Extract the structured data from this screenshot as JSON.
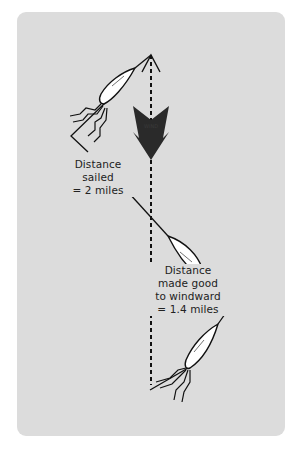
{
  "diagram": {
    "wind_arrow": {
      "label": "WIND",
      "direction": "down",
      "color": "#2a2a2a"
    },
    "labels": {
      "distance_sailed": {
        "lines": [
          "Distance",
          "sailed",
          "= 2 miles"
        ]
      },
      "distance_made_good": {
        "lines": [
          "Distance",
          "made good",
          "to windward",
          "= 1.4 miles"
        ]
      }
    },
    "boats": [
      {
        "name": "boat-upper",
        "heading": "port tack"
      },
      {
        "name": "boat-middle",
        "heading": "starboard tack"
      },
      {
        "name": "boat-lower",
        "heading": "port tack"
      }
    ],
    "colors": {
      "card_background": "#dcdcdc",
      "line": "#111111",
      "hull": "#ffffff"
    }
  }
}
